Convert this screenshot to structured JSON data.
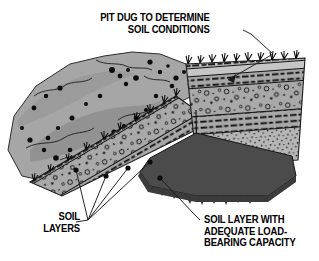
{
  "figure": {
    "background_color": "#ffffff",
    "width": 319,
    "height": 261
  },
  "labels": {
    "pit": {
      "name": "pit-dug-label",
      "line1": "PIT DUG TO DETERMINE",
      "line2": "SOIL CONDITIONS",
      "text": "PIT DUG TO DETERMINE\nSOIL CONDITIONS",
      "align": "right"
    },
    "soil_layers": {
      "name": "soil-layers-label",
      "line1": "SOIL",
      "line2": "LAYERS",
      "text": "SOIL\nLAYERS",
      "align": "right",
      "leader_count": 4
    },
    "bearing": {
      "name": "bearing-layer-label",
      "line1": "SOIL LAYER WITH",
      "line2": "ADEQUATE LOAD-",
      "line3": "BEARING CAPACITY",
      "text": "SOIL LAYER WITH\nADEQUATE LOAD-\nBEARING CAPACITY",
      "align": "left"
    }
  },
  "colors": {
    "ink": "#000000",
    "paper": "#ffffff",
    "spoil_base": "#a6a6a6",
    "spoil_shadow": "#8f8f8f",
    "stratum_light": "#bdbdbd",
    "stratum_mid": "#9e9e9e",
    "gravel_band": "#a9a9a9",
    "stipple_band": "#b5b5b5",
    "pit_floor": "#4b4b4b",
    "pit_floor_shadow": "#3c3c3c",
    "leader_line": "#1a1a1a"
  },
  "scene": {
    "spoil_pile": {
      "name": "excavated-spoil-pile",
      "description": "Irregular mound of excavated soil heaped to the left of the pit, mottled gray with scattered dark stones"
    },
    "pit": {
      "name": "test-pit",
      "description": "Rectangular excavation in perspective showing exposed stratified soil walls"
    },
    "ground_surface": {
      "name": "ground-surface",
      "description": "Turf surface with grass tufts along the pit rim"
    },
    "strata": [
      {
        "name": "topsoil-band",
        "pattern": "dashed-dark",
        "fill": "#bdbdbd"
      },
      {
        "name": "subsoil-band",
        "pattern": "dashed-dark",
        "fill": "#b0b0b0"
      },
      {
        "name": "gravel-band",
        "pattern": "circles",
        "fill": "#a9a9a9"
      },
      {
        "name": "lower-dashed-band",
        "pattern": "dashed-dark",
        "fill": "#9e9e9e"
      },
      {
        "name": "bearing-stratum",
        "pattern": "stipple",
        "fill": "#b5b5b5"
      }
    ],
    "pit_floor": {
      "name": "load-bearing-floor",
      "description": "Solid dark stratum at the base of the pit with adequate load-bearing capacity",
      "fill": "#4b4b4b"
    }
  }
}
